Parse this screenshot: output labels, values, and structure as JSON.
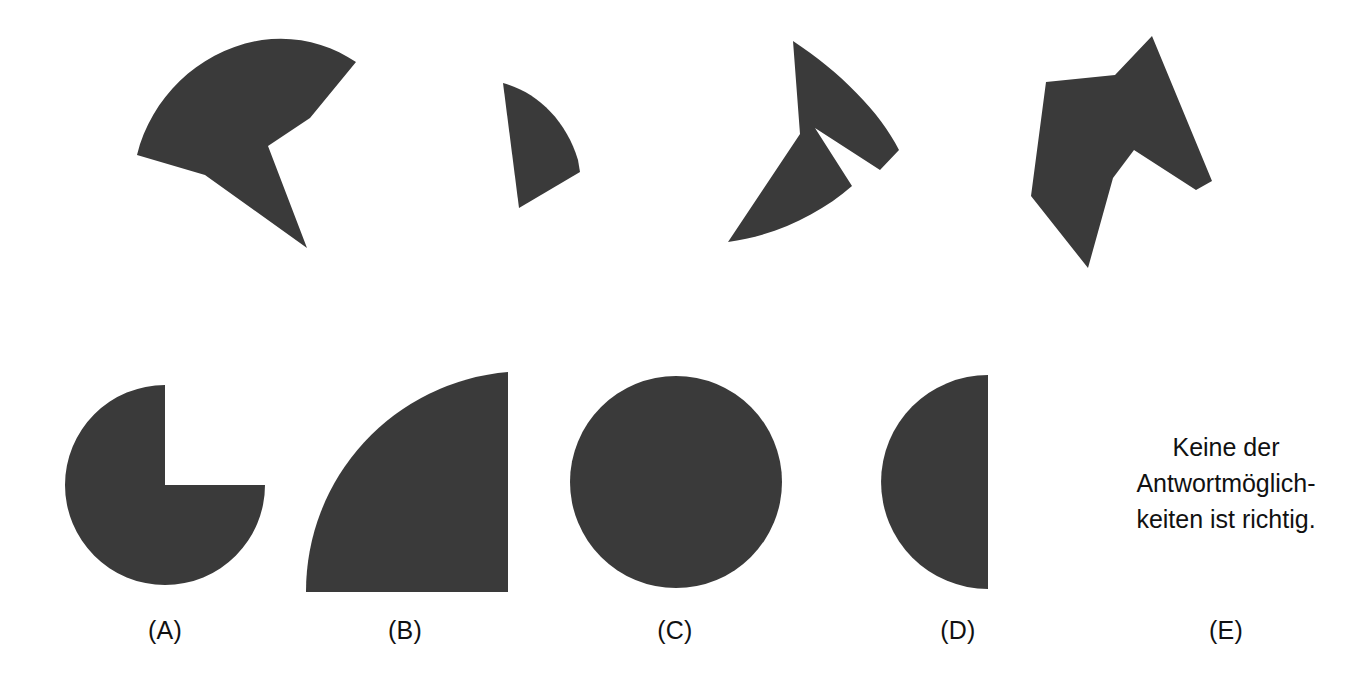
{
  "page": {
    "background_color": "#ffffff",
    "shape_fill_color": "#3a3a3a",
    "text_color": "#111111",
    "width": 1351,
    "height": 693
  },
  "puzzle": {
    "type": "shape-assembly-multiple-choice",
    "fragments": [
      {
        "id": "fragment-1",
        "name": "large-curved-wedge-with-notch",
        "description": "Large dark curved sector with a V notch on its right side and a pointed tail at lower right",
        "bbox": [
          137,
          38,
          310,
          248
        ]
      },
      {
        "id": "fragment-2",
        "name": "small-curved-wedge",
        "description": "Small dark quarter-sector wedge with curved right edge",
        "bbox": [
          486,
          83,
          580,
          208
        ]
      },
      {
        "id": "fragment-3",
        "name": "arrow-chevron-piece",
        "description": "Dark arrowhead / chevron shape pointing right with long lower tail",
        "bbox": [
          727,
          41,
          900,
          242
        ]
      },
      {
        "id": "fragment-4",
        "name": "angular-polygon-piece",
        "description": "Dark angular polygon with a notch at the bottom centre and two downward points",
        "bbox": [
          1031,
          36,
          1212,
          268
        ]
      }
    ]
  },
  "options": [
    {
      "key": "A",
      "label": "(A)",
      "shape": "circle-with-quarter-removed",
      "description": "Full disc with the upper-right quarter cut out",
      "label_x": 165
    },
    {
      "key": "B",
      "label": "(B)",
      "shape": "quarter-disc",
      "description": "Quarter disc with the right angle at the bottom-right corner",
      "label_x": 405
    },
    {
      "key": "C",
      "label": "(C)",
      "shape": "full-circle",
      "description": "Complete filled circle",
      "label_x": 675
    },
    {
      "key": "D",
      "label": "(D)",
      "shape": "half-disc-left",
      "description": "Semicircle with the flat edge on the right",
      "label_x": 958
    },
    {
      "key": "E",
      "label": "(E)",
      "shape": "text-option",
      "description": "Text answer option",
      "label_x": 1226
    }
  ],
  "none_of_the_above": {
    "name": "none-of-the-above-text",
    "lines": [
      "Keine der",
      "Antwortmöglich-",
      "keiten ist richtig."
    ],
    "full_text": "Keine der Antwortmöglichkeiten ist richtig."
  }
}
